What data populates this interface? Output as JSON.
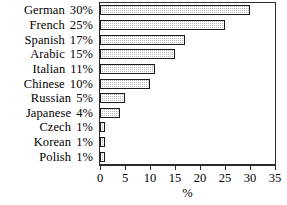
{
  "chart_data": {
    "type": "bar",
    "orientation": "horizontal",
    "title": "",
    "xlabel": "%",
    "ylabel": "",
    "xlim": [
      0,
      35
    ],
    "xticks": [
      0,
      5,
      10,
      15,
      20,
      25,
      30,
      35
    ],
    "grid": false,
    "legend": null,
    "categories": [
      "German",
      "French",
      "Spanish",
      "Arabic",
      "Italian",
      "Chinese",
      "Russian",
      "Japanese",
      "Czech",
      "Korean",
      "Polish"
    ],
    "values": [
      30,
      25,
      17,
      15,
      11,
      10,
      5,
      4,
      1,
      1,
      1
    ],
    "value_labels": [
      "30%",
      "25%",
      "17%",
      "15%",
      "11%",
      "10%",
      "5%",
      "4%",
      "1%",
      "1%",
      "1%"
    ],
    "bar_fill_color": "#b9b9b9",
    "bar_border_color": "#1a1a1a",
    "axis_color": "#2b2b2b"
  }
}
